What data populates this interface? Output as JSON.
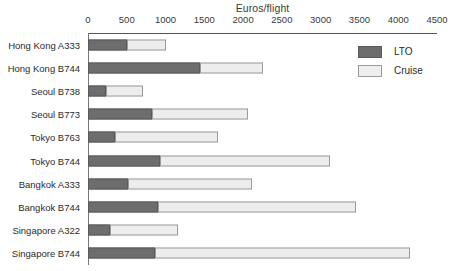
{
  "chart_data": {
    "type": "bar",
    "orientation": "horizontal",
    "stacked": true,
    "title": "Euros/flight",
    "xlabel": "Euros/flight",
    "ylabel": "",
    "xlim": [
      0,
      4500
    ],
    "xticks": [
      0,
      500,
      1000,
      1500,
      2000,
      2500,
      3000,
      3500,
      4000,
      4500
    ],
    "xtick_labels": [
      "0",
      "500",
      "1000",
      "1500",
      "2000",
      "2500",
      "3000",
      "3500",
      "4000",
      "4500"
    ],
    "grid": false,
    "legend_position": "top-right",
    "categories": [
      "Hong Kong A333",
      "Hong Kong B744",
      "Seoul B738",
      "Seoul B773",
      "Tokyo B763",
      "Tokyo B744",
      "Bangkok A333",
      "Bangkok B744",
      "Singapore A322",
      "Singapore B744"
    ],
    "series": [
      {
        "name": "LTO",
        "color": "#6d6d6d",
        "values": [
          500,
          1450,
          230,
          830,
          350,
          930,
          520,
          900,
          280,
          870
        ]
      },
      {
        "name": "Cruise",
        "color": "#ededed",
        "values": [
          500,
          810,
          480,
          1230,
          1330,
          2190,
          1590,
          2550,
          880,
          3280
        ]
      }
    ],
    "totals": [
      1000,
      2260,
      710,
      2060,
      1680,
      3120,
      2110,
      3450,
      1160,
      4150
    ]
  },
  "legend": {
    "items": [
      {
        "label": "LTO"
      },
      {
        "label": "Cruise"
      }
    ]
  }
}
